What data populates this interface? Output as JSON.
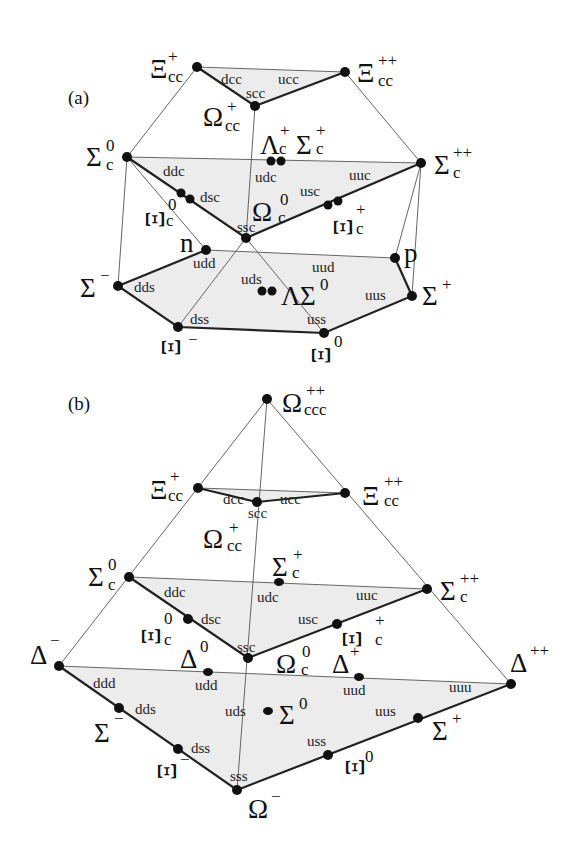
{
  "panel_a": {
    "label": "(a)",
    "nodes": [
      {
        "id": "Xi_cc_plus",
        "sym": "Ξ",
        "sub": "cc",
        "sup": "+",
        "quarks": "dcc"
      },
      {
        "id": "Xi_cc_plusplus",
        "sym": "Ξ",
        "sub": "cc",
        "sup": "++",
        "quarks": "ucc"
      },
      {
        "id": "Omega_cc_plus",
        "sym": "Ω",
        "sub": "cc",
        "sup": "+",
        "quarks": "scc"
      },
      {
        "id": "Sigma_c_0",
        "sym": "Σ",
        "sub": "c",
        "sup": "0",
        "quarks": "ddc"
      },
      {
        "id": "Lambda_c_plus",
        "sym": "Λ",
        "sub": "c",
        "sup": "+",
        "quarks": "udc"
      },
      {
        "id": "Sigma_c_plus",
        "sym": "Σ",
        "sub": "c",
        "sup": "+",
        "quarks": "udc"
      },
      {
        "id": "Sigma_c_plusplus",
        "sym": "Σ",
        "sub": "c",
        "sup": "++",
        "quarks": "uuc"
      },
      {
        "id": "Xi_c_0",
        "sym": "Ξ",
        "sub": "c",
        "sup": "0",
        "quarks": "dsc"
      },
      {
        "id": "Omega_c_0",
        "sym": "Ω",
        "sub": "c",
        "sup": "0",
        "quarks": "ssc"
      },
      {
        "id": "Xi_c_plus",
        "sym": "Ξ",
        "sub": "c",
        "sup": "+",
        "quarks": "usc"
      },
      {
        "id": "n",
        "sym": "n",
        "sub": "",
        "sup": "",
        "quarks": "udd"
      },
      {
        "id": "p",
        "sym": "p",
        "sub": "",
        "sup": "",
        "quarks": "uud"
      },
      {
        "id": "Sigma_minus",
        "sym": "Σ",
        "sub": "",
        "sup": "−",
        "quarks": "dds"
      },
      {
        "id": "Lambda",
        "sym": "Λ",
        "sub": "",
        "sup": "",
        "quarks": "uds"
      },
      {
        "id": "Sigma_0",
        "sym": "Σ",
        "sub": "",
        "sup": "0",
        "quarks": "uds"
      },
      {
        "id": "Sigma_plus",
        "sym": "Σ",
        "sub": "",
        "sup": "+",
        "quarks": "uus"
      },
      {
        "id": "Xi_minus",
        "sym": "Ξ",
        "sub": "",
        "sup": "−",
        "quarks": "dss"
      },
      {
        "id": "Xi_0",
        "sym": "Ξ",
        "sub": "",
        "sup": "0",
        "quarks": "uss"
      }
    ]
  },
  "panel_b": {
    "label": "(b)",
    "nodes": [
      {
        "id": "Omega_ccc",
        "sym": "Ω",
        "sub": "ccc",
        "sup": "++",
        "quarks": ""
      },
      {
        "id": "Xi_cc_plus",
        "sym": "Ξ",
        "sub": "cc",
        "sup": "+",
        "quarks": "dcc"
      },
      {
        "id": "Xi_cc_plusplus",
        "sym": "Ξ",
        "sub": "cc",
        "sup": "++",
        "quarks": "ucc"
      },
      {
        "id": "Omega_cc_plus",
        "sym": "Ω",
        "sub": "cc",
        "sup": "+",
        "quarks": "scc"
      },
      {
        "id": "Sigma_c_0",
        "sym": "Σ",
        "sub": "c",
        "sup": "0",
        "quarks": "ddc"
      },
      {
        "id": "Sigma_c_plus",
        "sym": "Σ",
        "sub": "c",
        "sup": "+",
        "quarks": "udc"
      },
      {
        "id": "Sigma_c_plusplus",
        "sym": "Σ",
        "sub": "c",
        "sup": "++",
        "quarks": "uuc"
      },
      {
        "id": "Xi_c_0",
        "sym": "Ξ",
        "sub": "c",
        "sup": "0",
        "quarks": "dsc"
      },
      {
        "id": "Omega_c_0",
        "sym": "Ω",
        "sub": "c",
        "sup": "0",
        "quarks": "ssc"
      },
      {
        "id": "Xi_c_plus",
        "sym": "Ξ",
        "sub": "c",
        "sup": "+",
        "quarks": "usc"
      },
      {
        "id": "Delta_minus",
        "sym": "Δ",
        "sub": "",
        "sup": "−",
        "quarks": "ddd"
      },
      {
        "id": "Delta_0",
        "sym": "Δ",
        "sub": "",
        "sup": "0",
        "quarks": "udd"
      },
      {
        "id": "Delta_plus",
        "sym": "Δ",
        "sub": "",
        "sup": "+",
        "quarks": "uud"
      },
      {
        "id": "Delta_plusplus",
        "sym": "Δ",
        "sub": "",
        "sup": "++",
        "quarks": "uuu"
      },
      {
        "id": "Sigma_minus",
        "sym": "Σ",
        "sub": "",
        "sup": "−",
        "quarks": "dds"
      },
      {
        "id": "Sigma_0",
        "sym": "Σ",
        "sub": "",
        "sup": "0",
        "quarks": "uds"
      },
      {
        "id": "Sigma_plus",
        "sym": "Σ",
        "sub": "",
        "sup": "+",
        "quarks": "uus"
      },
      {
        "id": "Xi_minus",
        "sym": "Ξ",
        "sub": "",
        "sup": "−",
        "quarks": "dss"
      },
      {
        "id": "Xi_0",
        "sym": "Ξ",
        "sub": "",
        "sup": "0",
        "quarks": "uss"
      },
      {
        "id": "Omega_minus",
        "sym": "Ω",
        "sub": "",
        "sup": "−",
        "quarks": "sss"
      }
    ]
  }
}
